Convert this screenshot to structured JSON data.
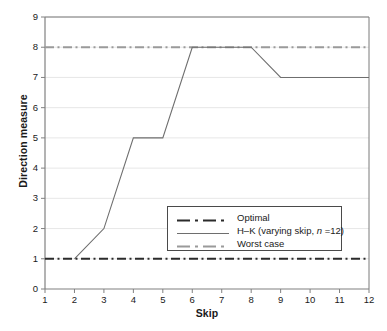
{
  "chart_data": {
    "type": "line",
    "title": "",
    "xlabel": "Skip",
    "ylabel": "Direction measure",
    "xlim": [
      1,
      12
    ],
    "ylim": [
      0,
      9
    ],
    "xticks": [
      "1",
      "2",
      "3",
      "4",
      "5",
      "6",
      "7",
      "8",
      "9",
      "10",
      "11",
      "12"
    ],
    "yticks": [
      "0",
      "1",
      "2",
      "3",
      "4",
      "5",
      "6",
      "7",
      "8",
      "9"
    ],
    "grid": true,
    "legend_position": "center-right-lower",
    "x": [
      1,
      2,
      3,
      4,
      5,
      6,
      7,
      8,
      9,
      10,
      11,
      12
    ],
    "series": [
      {
        "name": "Optimal",
        "style": "dash-dot",
        "color": "#2b2b2b",
        "width": 2,
        "values": [
          1,
          1,
          1,
          1,
          1,
          1,
          1,
          1,
          1,
          1,
          1,
          1
        ]
      },
      {
        "name": "H–K (varying skip, n =12)",
        "label_prefix": "H–K (varying skip, ",
        "label_italic": "n",
        "label_suffix": " =12)",
        "style": "solid",
        "color": "#6e6e6e",
        "width": 1,
        "values": [
          null,
          1,
          2,
          5,
          5,
          8,
          8,
          8,
          7,
          7,
          7,
          7
        ]
      },
      {
        "name": "Worst case",
        "style": "dash-dot",
        "color": "#9a9a9a",
        "width": 2,
        "values": [
          8,
          8,
          8,
          8,
          8,
          8,
          8,
          8,
          8,
          8,
          8,
          8
        ]
      }
    ]
  },
  "axes": {
    "x_title": "Skip",
    "y_title": "Direction measure"
  },
  "legend": {
    "entries": [
      {
        "label": "Optimal"
      },
      {
        "label": "H–K (varying skip, n =12)"
      },
      {
        "label": "Worst case"
      }
    ]
  },
  "colors": {
    "optimal": "#2b2b2b",
    "hk": "#6e6e6e",
    "worst": "#9a9a9a",
    "grid": "#e4e4e4",
    "axis": "#808080",
    "frame": "#7a7a7a",
    "background": "#ffffff"
  }
}
